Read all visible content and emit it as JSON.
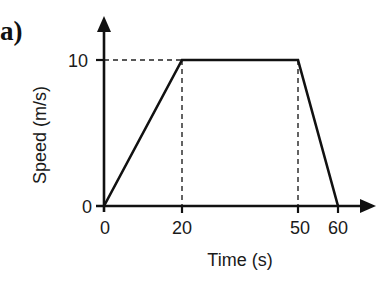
{
  "panel_label": "a)",
  "chart_data": {
    "type": "line",
    "title": "",
    "xlabel": "Time (s)",
    "ylabel": "Speed (m/s)",
    "x": [
      0,
      20,
      50,
      60
    ],
    "y": [
      0,
      10,
      10,
      0
    ],
    "series": [
      {
        "name": "speed",
        "x": [
          0,
          20,
          50,
          60
        ],
        "values": [
          0,
          10,
          10,
          0
        ]
      }
    ],
    "x_ticks": [
      "0",
      "20",
      "50",
      "60"
    ],
    "y_ticks": [
      "0",
      "10"
    ],
    "xlim": [
      0,
      65
    ],
    "ylim": [
      0,
      11.5
    ],
    "grid": false,
    "reference_lines": [
      {
        "type": "horizontal",
        "y": 10,
        "from_x": 0,
        "to_x": 20,
        "style": "dashed"
      },
      {
        "type": "vertical",
        "x": 20,
        "from_y": 0,
        "to_y": 10,
        "style": "dashed"
      },
      {
        "type": "vertical",
        "x": 50,
        "from_y": 0,
        "to_y": 10,
        "style": "dashed"
      }
    ],
    "legend": null
  },
  "colors": {
    "line": "#111111",
    "axis": "#111111",
    "text": "#1a1a1a"
  }
}
